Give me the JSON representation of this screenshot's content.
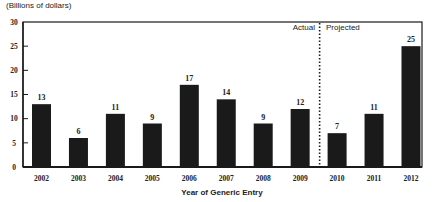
{
  "chart_data": {
    "type": "bar",
    "title": "",
    "unit_label": "(Billions of dollars)",
    "xlabel": "Year of Generic Entry",
    "ylabel": "(Billions of dollars)",
    "ylim": [
      0,
      30
    ],
    "yticks": [
      0,
      5,
      10,
      15,
      20,
      25,
      30
    ],
    "categories": [
      "2002",
      "2003",
      "2004",
      "2005",
      "2006",
      "2007",
      "2008",
      "2009",
      "2010",
      "2011",
      "2012"
    ],
    "values": [
      13,
      6,
      11,
      9,
      17,
      14,
      9,
      12,
      7,
      11,
      25
    ],
    "data_labels": [
      "13",
      "6",
      "11",
      "9",
      "17",
      "14",
      "9",
      "12",
      "7",
      "11",
      "25"
    ],
    "annotations": {
      "divider_between": [
        "2009",
        "2010"
      ],
      "left_label": "Actual",
      "right_label": "Projected"
    },
    "bar_color": "#1a1a1a",
    "grid": false,
    "legend": "none"
  }
}
